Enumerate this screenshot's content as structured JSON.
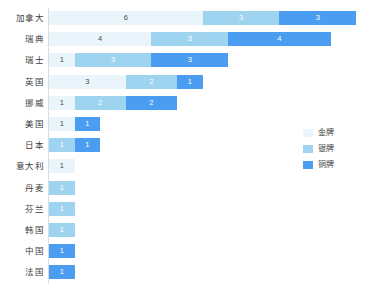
{
  "chart_data": {
    "type": "bar",
    "orientation": "horizontal",
    "stacked": true,
    "title": "",
    "subtitle": "",
    "xlabel": "",
    "ylabel": "",
    "grid": false,
    "xlim": [
      0,
      12
    ],
    "legend_position": "right",
    "categories": [
      "加拿大",
      "瑞典",
      "瑞士",
      "英国",
      "挪威",
      "美国",
      "日本",
      "意大利",
      "丹麦",
      "芬兰",
      "韩国",
      "中国",
      "法国"
    ],
    "series": [
      {
        "name": "金牌",
        "color": "#eaf4fb",
        "values": [
          6,
          4,
          1,
          3,
          1,
          1,
          0,
          1,
          0,
          0,
          0,
          0,
          0
        ]
      },
      {
        "name": "银牌",
        "color": "#9fd4f0",
        "values": [
          3,
          3,
          3,
          2,
          2,
          0,
          1,
          0,
          1,
          1,
          1,
          0,
          0
        ]
      },
      {
        "name": "铜牌",
        "color": "#4a9df0",
        "values": [
          3,
          4,
          3,
          1,
          2,
          1,
          1,
          0,
          0,
          0,
          0,
          1,
          1
        ]
      }
    ],
    "totals": [
      12,
      11,
      7,
      6,
      5,
      2,
      2,
      1,
      1,
      1,
      1,
      1,
      1
    ]
  },
  "legend": {
    "items": [
      {
        "label": "金牌",
        "color": "#eaf4fb"
      },
      {
        "label": "银牌",
        "color": "#9fd4f0"
      },
      {
        "label": "铜牌",
        "color": "#4a9df0"
      }
    ]
  },
  "colors": {
    "gold": "#eaf4fb",
    "silver": "#9fd4f0",
    "bronze": "#4a9df0",
    "axis": "#d8dde3",
    "label_text": "#3c3c3c",
    "background": "#ffffff"
  }
}
